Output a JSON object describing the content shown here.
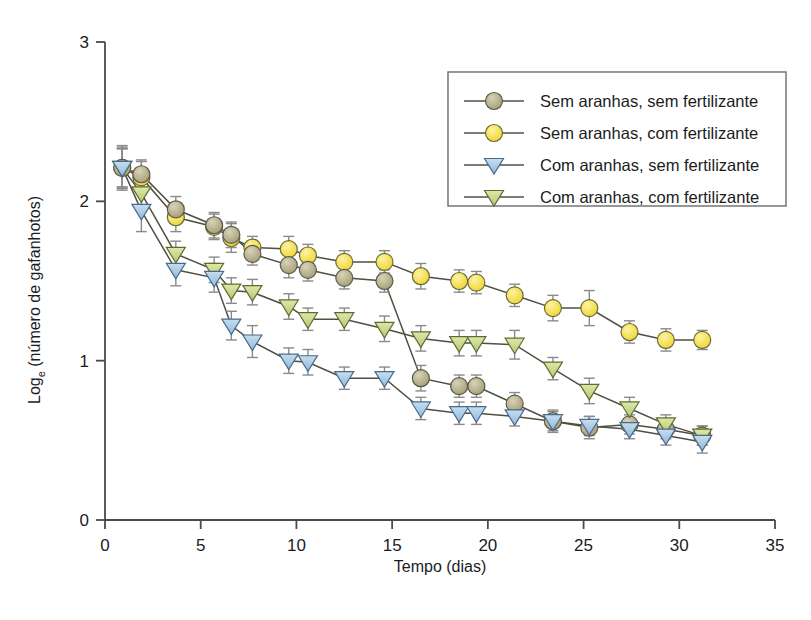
{
  "chart_data": {
    "type": "line",
    "title": "",
    "subtitle": "",
    "xlabel": "Tempo (dias)",
    "ylabel_main": "Log",
    "ylabel_sub": "e",
    "ylabel_rest": " (número de gafanhotos)",
    "ylabel_full": "Loge (número de gafanhotos)",
    "xlim": [
      0,
      35
    ],
    "ylim": [
      0,
      3
    ],
    "xticks": [
      0,
      5,
      10,
      15,
      20,
      25,
      30,
      35
    ],
    "yticks": [
      0,
      1,
      2,
      3
    ],
    "xtick_labels": [
      "0",
      "5",
      "10",
      "15",
      "20",
      "25",
      "30",
      "35"
    ],
    "ytick_labels": [
      "0",
      "1",
      "2",
      "3"
    ],
    "grid": false,
    "legend_position": "top-right",
    "error_bars": "standard error",
    "series": [
      {
        "name": "Sem aranhas, sem fertilizante",
        "marker": "circle",
        "color": "#b3ac86",
        "edge": "#5a5a4a",
        "x": [
          0.9,
          1.9,
          3.7,
          5.7,
          6.6,
          7.7,
          9.6,
          10.6,
          12.5,
          14.6,
          16.5,
          18.5,
          19.4,
          21.4,
          23.4,
          25.3,
          27.4,
          29.3,
          31.2
        ],
        "y": [
          2.21,
          2.17,
          1.95,
          1.85,
          1.79,
          1.67,
          1.6,
          1.57,
          1.52,
          1.5,
          0.89,
          0.84,
          0.84,
          0.73,
          0.62,
          0.58,
          0.6,
          0.57,
          0.53
        ],
        "err": [
          0.12,
          0.09,
          0.08,
          0.08,
          0.08,
          0.07,
          0.08,
          0.07,
          0.07,
          0.07,
          0.08,
          0.07,
          0.07,
          0.07,
          0.07,
          0.07,
          0.06,
          0.06,
          0.06
        ]
      },
      {
        "name": "Sem aranhas, com fertilizante",
        "marker": "circle",
        "color": "#f5e14e",
        "edge": "#6b6b3a",
        "x": [
          0.9,
          1.9,
          3.7,
          5.7,
          6.6,
          7.7,
          9.6,
          10.6,
          12.5,
          14.6,
          16.5,
          18.5,
          19.4,
          21.4,
          23.4,
          25.3,
          27.4,
          29.3,
          31.2
        ],
        "y": [
          2.21,
          2.15,
          1.9,
          1.84,
          1.77,
          1.71,
          1.7,
          1.66,
          1.62,
          1.62,
          1.53,
          1.5,
          1.49,
          1.41,
          1.33,
          1.33,
          1.18,
          1.13,
          1.13
        ],
        "err": [
          0.13,
          0.1,
          0.09,
          0.08,
          0.09,
          0.07,
          0.08,
          0.07,
          0.07,
          0.07,
          0.08,
          0.07,
          0.07,
          0.07,
          0.08,
          0.11,
          0.07,
          0.07,
          0.06
        ]
      },
      {
        "name": "Com aranhas, sem fertilizante",
        "marker": "triangle-down",
        "color": "#aaccea",
        "edge": "#4a6a8a",
        "x": [
          0.9,
          1.9,
          3.7,
          5.7,
          6.6,
          7.7,
          9.6,
          10.6,
          12.5,
          14.6,
          16.5,
          18.5,
          19.4,
          21.4,
          23.4,
          25.3,
          27.4,
          29.3,
          31.2
        ],
        "y": [
          2.21,
          1.94,
          1.57,
          1.52,
          1.22,
          1.12,
          1.0,
          0.99,
          0.89,
          0.89,
          0.7,
          0.67,
          0.67,
          0.65,
          0.62,
          0.59,
          0.57,
          0.53,
          0.49
        ],
        "err": [
          0.14,
          0.13,
          0.1,
          0.09,
          0.09,
          0.1,
          0.08,
          0.08,
          0.07,
          0.07,
          0.07,
          0.07,
          0.07,
          0.06,
          0.06,
          0.06,
          0.06,
          0.06,
          0.07
        ]
      },
      {
        "name": "Com aranhas, com fertilizante",
        "marker": "triangle-down",
        "color": "#c9da8d",
        "edge": "#5f6b33",
        "x": [
          0.9,
          1.9,
          3.7,
          5.7,
          6.6,
          7.7,
          9.6,
          10.6,
          12.5,
          14.6,
          16.5,
          18.5,
          19.4,
          21.4,
          23.4,
          25.3,
          27.4,
          29.3,
          31.2
        ],
        "y": [
          2.21,
          2.05,
          1.67,
          1.57,
          1.44,
          1.43,
          1.34,
          1.26,
          1.26,
          1.2,
          1.14,
          1.11,
          1.11,
          1.1,
          0.95,
          0.81,
          0.7,
          0.6,
          0.53
        ],
        "err": [
          0.12,
          0.11,
          0.08,
          0.08,
          0.08,
          0.08,
          0.08,
          0.07,
          0.07,
          0.08,
          0.08,
          0.08,
          0.08,
          0.09,
          0.07,
          0.08,
          0.07,
          0.06,
          0.06
        ]
      }
    ]
  },
  "legend": {
    "items": [
      {
        "label": "Sem aranhas, sem fertilizante",
        "marker": "circle",
        "color": "#b3ac86"
      },
      {
        "label": "Sem aranhas, com fertilizante",
        "marker": "circle",
        "color": "#f5e14e"
      },
      {
        "label": "Com aranhas, sem fertilizante",
        "marker": "triangle-down",
        "color": "#aaccea"
      },
      {
        "label": "Com aranhas, com fertilizante",
        "marker": "triangle-down",
        "color": "#c9da8d"
      }
    ]
  }
}
